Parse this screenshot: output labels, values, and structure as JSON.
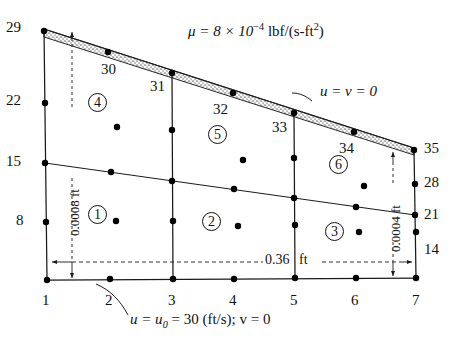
{
  "figure": {
    "viscosity_label": "μ = 8 × 10",
    "viscosity_exp": "−4",
    "viscosity_units_a": " lbf/(s-ft",
    "viscosity_units_b": "2",
    "viscosity_units_c": ")",
    "wall_bc": "u = v = 0",
    "inlet_bc_a": "u = u",
    "inlet_bc_sub": "0",
    "inlet_bc_b": " = 30 (ft/s); v = 0",
    "width_dim": "0.36",
    "width_dim_units": "ft",
    "left_height_dim": "0.0008 ft",
    "right_height_dim": "0.0004 ft"
  },
  "nodes": {
    "bottom": [
      "1",
      "2",
      "3",
      "4",
      "5",
      "6",
      "7"
    ],
    "left": [
      "1",
      "8",
      "15",
      "22",
      "29"
    ],
    "right": [
      "7",
      "14",
      "21",
      "28",
      "35"
    ],
    "top": [
      "29",
      "30",
      "31",
      "32",
      "33",
      "34",
      "35"
    ]
  },
  "elements": [
    {
      "id": "1",
      "label": "1"
    },
    {
      "id": "2",
      "label": "2"
    },
    {
      "id": "3",
      "label": "3"
    },
    {
      "id": "4",
      "label": "4"
    },
    {
      "id": "5",
      "label": "5"
    },
    {
      "id": "6",
      "label": "6"
    }
  ],
  "colors": {
    "line": "#1a1a1a",
    "node": "#000000",
    "hatch": "#8a8a8a",
    "background": "#ffffff"
  },
  "geometry": {
    "corner_top_left": [
      44,
      29
    ],
    "corner_top_right": [
      414,
      148
    ],
    "corner_bottom_left": [
      47,
      280
    ],
    "corner_bottom_right": [
      416,
      278
    ],
    "columns_x": [
      47,
      108,
      172,
      233,
      294,
      355,
      416
    ],
    "note": "Six 9-node quadratic elements in a 3 x 2 grid over a wedge domain"
  }
}
